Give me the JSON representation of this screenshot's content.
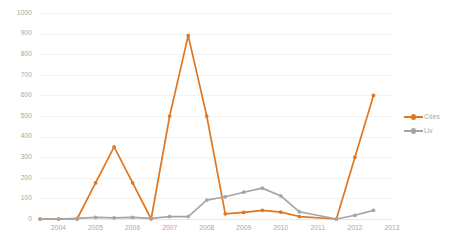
{
  "chart_data": {
    "type": "line",
    "title": "",
    "xlabel": "",
    "ylabel": "",
    "ylim": [
      0,
      1000
    ],
    "y_ticks": [
      0,
      100,
      200,
      300,
      400,
      500,
      600,
      700,
      800,
      900,
      1000
    ],
    "y_tick_labels": [
      "0",
      "100",
      "200",
      "300",
      "400",
      "500",
      "600",
      "700",
      "800",
      "900",
      "1000"
    ],
    "x_tick_labels": [
      "2004",
      "2005",
      "2006",
      "2007",
      "2008",
      "2009",
      "2010",
      "2011",
      "2012",
      "2013"
    ],
    "x_axis_ticks_values": [
      2004,
      2005,
      2006,
      2007,
      2008,
      2009,
      2010,
      2011,
      2012,
      2013
    ],
    "xlim": [
      2003.5,
      2013.0
    ],
    "grid": true,
    "legend_position": "right",
    "markers": true,
    "x": [
      2003.5,
      2004.0,
      2004.5,
      2005.0,
      2005.5,
      2006.0,
      2006.5,
      2007.0,
      2007.5,
      2008.0,
      2008.5,
      2009.0,
      2009.5,
      2010.0,
      2010.5,
      2011.5,
      2012.0,
      2012.5
    ],
    "series": [
      {
        "name": "Cdes",
        "color": "#E0761F",
        "values": [
          0,
          0,
          0,
          175,
          350,
          175,
          0,
          500,
          890,
          500,
          25,
          32,
          42,
          33,
          12,
          0,
          300,
          600
        ]
      },
      {
        "name": "Liv",
        "color": "#A5A5A5",
        "values": [
          0,
          0,
          3,
          8,
          5,
          8,
          3,
          12,
          12,
          92,
          108,
          130,
          150,
          112,
          35,
          0,
          18,
          42
        ]
      }
    ]
  },
  "legend": {
    "items": [
      {
        "label": "Cdes",
        "color": "#E0761F",
        "marker": "circle-marker"
      },
      {
        "label": "Liv",
        "color": "#A5A5A5",
        "marker": "circle-marker"
      }
    ]
  }
}
